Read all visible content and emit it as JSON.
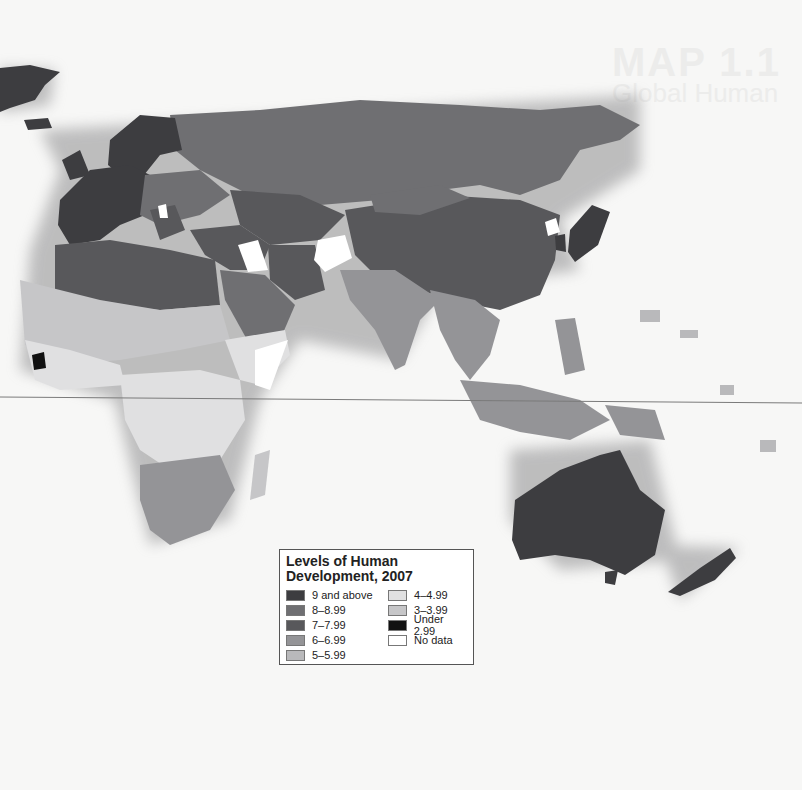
{
  "ghost_heading": {
    "title": "MAP 1.1",
    "subtitle": "Global Human"
  },
  "legend": {
    "title_line1": "Levels of Human",
    "title_line2": "Development, 2007",
    "items": [
      {
        "label": "9 and above",
        "color": "#3d3d40"
      },
      {
        "label": "8–8.99",
        "color": "#6f6f72"
      },
      {
        "label": "7–7.99",
        "color": "#58585b"
      },
      {
        "label": "6–6.99",
        "color": "#949497"
      },
      {
        "label": "5–5.99",
        "color": "#b9b9bb"
      },
      {
        "label": "4–4.99",
        "color": "#e0e0e1"
      },
      {
        "label": "3–3.99",
        "color": "#c6c6c8"
      },
      {
        "label": "Under 2.99",
        "color": "#111111"
      },
      {
        "label": "No data",
        "color": "#ffffff"
      }
    ]
  },
  "regions": {
    "greenland": "9 and above",
    "western_europe": "9 and above",
    "russia": "7–7.99",
    "china_central_asia": "7–7.99",
    "north_africa": "7–7.99",
    "india": "6–6.99",
    "sub_saharan_africa": "4–4.99",
    "southern_africa": "6–6.99",
    "australia": "9 and above",
    "new_zealand": "9 and above",
    "japan": "9 and above",
    "indonesia": "6–6.99"
  },
  "equator_label": ""
}
